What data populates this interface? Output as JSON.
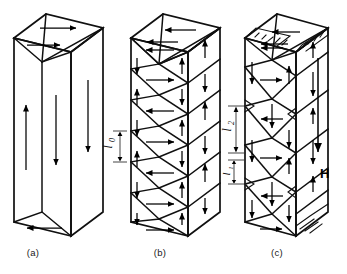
{
  "figure": {
    "background_color": "#ffffff",
    "line_color": "#101010",
    "panels": [
      {
        "id": "a",
        "label": "(a)",
        "description": "Simple 180-degree slab domains closed by triangular closure domains at top and bottom",
        "front_domain_count": 2,
        "front_arrow_directions": [
          "up",
          "down"
        ],
        "side_arrow_directions": [
          "down"
        ],
        "top_arrow_directions": [
          "right",
          "right"
        ],
        "bottom_arrow_directions": [
          "left"
        ]
      },
      {
        "id": "b",
        "label": "(b)",
        "description": "Refined domain structure with equal period spacing, closure domains of equal size",
        "period_label": "l",
        "period_subscript": "0",
        "front_arrow_directions": [
          "left",
          "right",
          "left",
          "right",
          "left",
          "right"
        ],
        "side_arrow_directions": [
          "up",
          "down",
          "up",
          "down",
          "up"
        ],
        "top_arrow_directions": [
          "left",
          "left"
        ]
      },
      {
        "id": "c",
        "label": "(c)",
        "description": "Domain structure under applied field H, with unequal domain widths and supplementary spike domains on top and bottom faces",
        "width_labels": [
          {
            "symbol": "l",
            "subscript": "2",
            "meaning": "wide domain width"
          },
          {
            "symbol": "l",
            "subscript": "1",
            "meaning": "narrow domain width"
          }
        ],
        "field_label": "H",
        "field_direction": "down",
        "front_arrow_directions": [
          "left",
          "right",
          "left",
          "right",
          "left",
          "right"
        ],
        "side_arrow_directions": [
          "up",
          "down",
          "up",
          "down",
          "up"
        ],
        "top_arrow_directions": [
          "left",
          "left"
        ]
      }
    ]
  }
}
